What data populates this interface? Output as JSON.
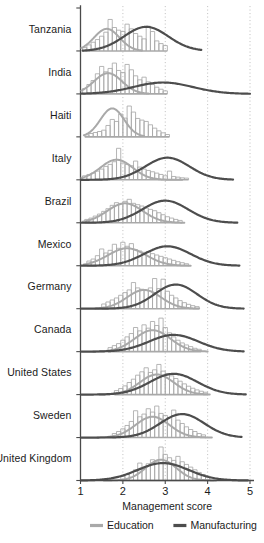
{
  "chart_data": {
    "type": "area",
    "title": "",
    "xlabel": "Management score",
    "ylabel": "",
    "xlim": [
      1,
      5
    ],
    "xticks": [
      1,
      2,
      3,
      4,
      5
    ],
    "grid": true,
    "grid_axis": "x",
    "legend": {
      "position": "bottom",
      "entries": [
        {
          "name": "Education",
          "color": "#a9a9a9"
        },
        {
          "name": "Manufacturing",
          "color": "#4d4d4d"
        }
      ]
    },
    "categories": [
      "Tanzania",
      "India",
      "Haiti",
      "Italy",
      "Brazil",
      "Mexico",
      "Germany",
      "Canada",
      "United States",
      "Sweden",
      "United Kingdom"
    ],
    "bin_width": 0.1,
    "panels": [
      {
        "country": "Tanzania",
        "education": {
          "bin_start": 1.05,
          "hist": [
            0.1,
            0.18,
            0.26,
            0.34,
            0.44,
            0.56,
            0.94,
            0.7,
            0.62,
            0.58,
            0.8,
            0.66,
            0.52,
            0.44,
            0.36,
            0.74,
            0.58,
            0.3,
            0.22,
            0.16
          ],
          "curve_peak": 1.62,
          "curve_sd": 0.3,
          "curve_height": 0.66,
          "curve_x0": 1.02,
          "curve_x1": 2.45
        },
        "manufacturing": {
          "curve_peak": 2.55,
          "curve_sd": 0.52,
          "curve_height": 0.72,
          "curve_x0": 1.05,
          "curve_x1": 3.85
        }
      },
      {
        "country": "India",
        "education": {
          "bin_start": 1.05,
          "hist": [
            0.16,
            0.28,
            0.4,
            0.6,
            0.82,
            0.66,
            0.76,
            0.92,
            0.7,
            0.64,
            0.88,
            0.72,
            0.54,
            0.42,
            0.5,
            0.36,
            0.28,
            0.2,
            0.14,
            0.09
          ],
          "curve_peak": 1.65,
          "curve_sd": 0.33,
          "curve_height": 0.62,
          "curve_x0": 1.02,
          "curve_x1": 2.6
        },
        "manufacturing": {
          "curve_peak": 2.95,
          "curve_sd": 0.7,
          "curve_height": 0.34,
          "curve_x0": 1.02,
          "curve_x1": 5.0
        }
      },
      {
        "country": "Haiti",
        "education": {
          "bin_start": 1.1,
          "hist": [
            0.06,
            0.1,
            0.13,
            0.16,
            0.2,
            0.34,
            0.52,
            0.46,
            0.68,
            0.56,
            0.92,
            0.74,
            0.55,
            0.5,
            0.46,
            0.36,
            0.26,
            0.18,
            0.12,
            0.07
          ],
          "curve_peak": 1.75,
          "curve_sd": 0.28,
          "curve_height": 0.85,
          "curve_x0": 1.08,
          "curve_x1": 2.5
        },
        "manufacturing": null
      },
      {
        "country": "Italy",
        "education": {
          "bin_start": 1.05,
          "hist": [
            0.12,
            0.16,
            0.2,
            0.26,
            0.32,
            0.4,
            0.46,
            0.54,
            0.94,
            0.5,
            0.46,
            0.42,
            0.56,
            0.38,
            0.32,
            0.28,
            0.24,
            0.2,
            0.16,
            0.12,
            0.26,
            0.1,
            0.08,
            0.06,
            0.05
          ],
          "curve_peak": 1.85,
          "curve_sd": 0.38,
          "curve_height": 0.6,
          "curve_x0": 1.02,
          "curve_x1": 3.4
        },
        "manufacturing": {
          "curve_peak": 3.05,
          "curve_sd": 0.52,
          "curve_height": 0.66,
          "curve_x0": 1.02,
          "curve_x1": 4.6
        }
      },
      {
        "country": "Brazil",
        "education": {
          "bin_start": 1.1,
          "hist": [
            0.1,
            0.14,
            0.2,
            0.26,
            0.34,
            0.42,
            0.52,
            0.6,
            0.56,
            0.64,
            0.7,
            0.58,
            0.54,
            0.5,
            0.44,
            0.4,
            0.36,
            0.3,
            0.24,
            0.18,
            0.14,
            0.1,
            0.07
          ],
          "curve_peak": 2.05,
          "curve_sd": 0.42,
          "curve_height": 0.58,
          "curve_x0": 1.05,
          "curve_x1": 3.45
        },
        "manufacturing": {
          "curve_peak": 3.0,
          "curve_sd": 0.54,
          "curve_height": 0.66,
          "curve_x0": 1.02,
          "curve_x1": 4.7
        }
      },
      {
        "country": "Mexico",
        "education": {
          "bin_start": 1.15,
          "hist": [
            0.14,
            0.2,
            0.3,
            0.5,
            0.38,
            0.46,
            0.64,
            0.52,
            0.7,
            0.58,
            0.66,
            0.48,
            0.44,
            0.4,
            0.42,
            0.36,
            0.32,
            0.28,
            0.24,
            0.2,
            0.16,
            0.12,
            0.09,
            0.06
          ],
          "curve_peak": 2.1,
          "curve_sd": 0.45,
          "curve_height": 0.52,
          "curve_x0": 1.08,
          "curve_x1": 3.6
        },
        "manufacturing": {
          "curve_peak": 3.05,
          "curve_sd": 0.55,
          "curve_height": 0.58,
          "curve_x0": 1.02,
          "curve_x1": 4.75
        }
      },
      {
        "country": "Germany",
        "education": {
          "bin_start": 1.5,
          "hist": [
            0.14,
            0.2,
            0.26,
            0.32,
            0.4,
            0.48,
            0.56,
            0.78,
            0.62,
            0.58,
            0.54,
            0.62,
            0.9,
            0.6,
            0.88,
            0.52,
            0.4,
            0.32,
            0.24,
            0.18,
            0.13,
            0.09,
            0.06
          ],
          "curve_peak": 2.5,
          "curve_sd": 0.4,
          "curve_height": 0.56,
          "curve_x0": 1.35,
          "curve_x1": 3.8
        },
        "manufacturing": {
          "curve_peak": 3.25,
          "curve_sd": 0.5,
          "curve_height": 0.72,
          "curve_x0": 1.02,
          "curve_x1": 4.85
        }
      },
      {
        "country": "Canada",
        "education": {
          "bin_start": 1.65,
          "hist": [
            0.12,
            0.18,
            0.24,
            0.34,
            0.44,
            0.54,
            0.72,
            0.62,
            0.8,
            0.7,
            0.9,
            0.78,
            1.0,
            0.72,
            0.56,
            0.44,
            0.34,
            0.26,
            0.2,
            0.15,
            0.1,
            0.07
          ],
          "curve_peak": 2.7,
          "curve_sd": 0.42,
          "curve_height": 0.64,
          "curve_x0": 1.3,
          "curve_x1": 4.0
        },
        "manufacturing": {
          "curve_peak": 3.2,
          "curve_sd": 0.58,
          "curve_height": 0.5,
          "curve_x0": 1.02,
          "curve_x1": 4.85
        }
      },
      {
        "country": "United States",
        "education": {
          "bin_start": 1.8,
          "hist": [
            0.12,
            0.18,
            0.26,
            0.36,
            0.46,
            0.58,
            0.68,
            0.8,
            0.66,
            0.74,
            0.9,
            0.7,
            0.62,
            0.56,
            0.48,
            0.4,
            0.32,
            0.25,
            0.19,
            0.14,
            0.1,
            0.07
          ],
          "curve_peak": 2.8,
          "curve_sd": 0.4,
          "curve_height": 0.6,
          "curve_x0": 1.45,
          "curve_x1": 4.05
        },
        "manufacturing": {
          "curve_peak": 3.2,
          "curve_sd": 0.56,
          "curve_height": 0.62,
          "curve_x0": 1.02,
          "curve_x1": 4.9
        }
      },
      {
        "country": "Sweden",
        "education": {
          "bin_start": 1.75,
          "hist": [
            0.12,
            0.18,
            0.26,
            0.36,
            0.48,
            0.8,
            0.62,
            0.7,
            0.86,
            0.76,
            0.94,
            0.72,
            0.66,
            0.6,
            0.82,
            0.52,
            0.42,
            0.32,
            0.24,
            0.18,
            0.12,
            0.08
          ],
          "curve_peak": 2.7,
          "curve_sd": 0.4,
          "curve_height": 0.62,
          "curve_x0": 1.4,
          "curve_x1": 4.1
        },
        "manufacturing": {
          "curve_peak": 3.4,
          "curve_sd": 0.52,
          "curve_height": 0.7,
          "curve_x0": 1.02,
          "curve_x1": 4.8
        }
      },
      {
        "country": "United Kingdom",
        "education": {
          "bin_start": 1.95,
          "hist": [
            0.12,
            0.18,
            0.24,
            0.32,
            0.52,
            0.4,
            0.5,
            0.62,
            0.58,
            1.0,
            0.78,
            0.68,
            0.6,
            0.72,
            0.56,
            0.48,
            0.4,
            0.32,
            0.24,
            0.18,
            0.13,
            0.09
          ],
          "curve_peak": 2.9,
          "curve_sd": 0.36,
          "curve_height": 0.62,
          "curve_x0": 1.55,
          "curve_x1": 4.2
        },
        "manufacturing": {
          "curve_peak": 2.95,
          "curve_sd": 0.6,
          "curve_height": 0.52,
          "curve_x0": 1.02,
          "curve_x1": 4.95
        }
      }
    ]
  },
  "axis": {
    "xlabel": "Management score",
    "ticks": [
      "1",
      "2",
      "3",
      "4",
      "5"
    ]
  },
  "legend": {
    "education_label": "Education",
    "manufacturing_label": "Manufacturing"
  },
  "colors": {
    "education": "#a9a9a9",
    "manufacturing": "#4d4d4d",
    "axis": "#4a4a4a",
    "grid": "#b5b5b5",
    "text": "#1b1b1b"
  },
  "countries": [
    "Tanzania",
    "India",
    "Haiti",
    "Italy",
    "Brazil",
    "Mexico",
    "Germany",
    "Canada",
    "United States",
    "Sweden",
    "United Kingdom"
  ]
}
